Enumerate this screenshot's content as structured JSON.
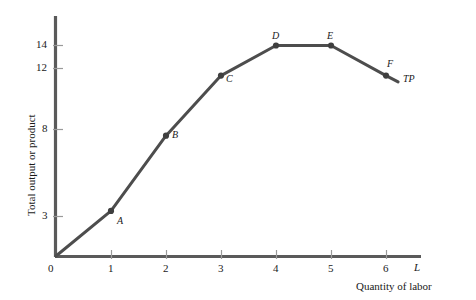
{
  "chart_data": {
    "type": "line",
    "title": "",
    "subtitle": "",
    "xlabel": "Quantity of labor",
    "ylabel": "Total output or product",
    "x_axis_letter": "L",
    "series_label": "TP",
    "xlim": [
      0,
      6.65
    ],
    "ylim": [
      0,
      15.6
    ],
    "grid": false,
    "legend_position": "inline-right",
    "x": [
      0,
      1,
      2,
      3,
      4,
      5,
      6
    ],
    "values": [
      0,
      3,
      8,
      12,
      14,
      14,
      12
    ],
    "x_tick_labels": [
      "0",
      "1",
      "2",
      "3",
      "4",
      "5",
      "6"
    ],
    "y_tick_labels": [
      "3",
      "8",
      "12",
      "14"
    ],
    "y_tick_values": [
      3,
      8,
      12,
      14
    ],
    "point_labels": [
      "",
      "A",
      "B",
      "C",
      "D",
      "E",
      "F"
    ],
    "annotations": [
      {
        "text": "A",
        "x": 1,
        "y": 3
      },
      {
        "text": "B",
        "x": 2,
        "y": 8
      },
      {
        "text": "C",
        "x": 3,
        "y": 12
      },
      {
        "text": "D",
        "x": 4,
        "y": 14
      },
      {
        "text": "E",
        "x": 5,
        "y": 14
      },
      {
        "text": "F",
        "x": 6,
        "y": 12
      },
      {
        "text": "TP",
        "x": 6.5,
        "y": 11.4
      }
    ],
    "colors": {
      "curve": "#4d4d4d",
      "axis": "#5a5a5a",
      "tick": "#8c8c8c",
      "text": "#1a1a1a",
      "background": "#ffffff"
    }
  },
  "axes": {
    "y_title": "Total output or product",
    "x_title": "Quantity of labor",
    "x_axis_symbol": "L",
    "origin_label": "0"
  },
  "ticks": {
    "y": [
      {
        "label": "14",
        "value": 14
      },
      {
        "label": "12",
        "value": 12
      },
      {
        "label": "8",
        "value": 8
      },
      {
        "label": "3",
        "value": 3
      }
    ],
    "x": [
      {
        "label": "0",
        "value": 0
      },
      {
        "label": "1",
        "value": 1
      },
      {
        "label": "2",
        "value": 2
      },
      {
        "label": "3",
        "value": 3
      },
      {
        "label": "4",
        "value": 4
      },
      {
        "label": "5",
        "value": 5
      },
      {
        "label": "6",
        "value": 6
      }
    ]
  },
  "curve": {
    "label": "TP",
    "points": [
      {
        "name": "",
        "x": 0,
        "y": 0
      },
      {
        "name": "A",
        "x": 1,
        "y": 3
      },
      {
        "name": "B",
        "x": 2,
        "y": 8
      },
      {
        "name": "C",
        "x": 3,
        "y": 12
      },
      {
        "name": "D",
        "x": 4,
        "y": 14
      },
      {
        "name": "E",
        "x": 5,
        "y": 14
      },
      {
        "name": "F",
        "x": 6,
        "y": 12
      }
    ]
  }
}
